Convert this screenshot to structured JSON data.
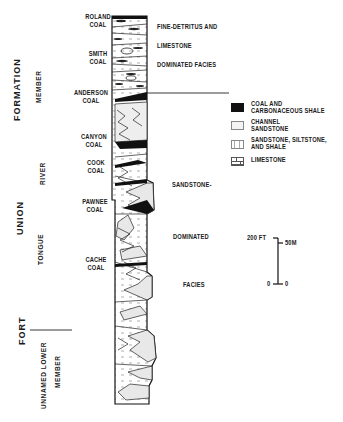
{
  "coal_labels": [
    {
      "name": "ROLAND",
      "sub": "COAL"
    },
    {
      "name": "SMITH",
      "sub": "COAL"
    },
    {
      "name": "ANDERSON",
      "sub": "COAL"
    },
    {
      "name": "CANYON",
      "sub": "COAL"
    },
    {
      "name": "COOK",
      "sub": "COAL"
    },
    {
      "name": "PAWNEE",
      "sub": "COAL"
    },
    {
      "name": "CACHE",
      "sub": "COAL"
    }
  ],
  "stratigraphy": {
    "formation_line1": "FORMATION",
    "formation_line2": "UNION",
    "formation_line3": "FORT",
    "member_upper_a": "MEMBER",
    "member_upper_b": "RIVER",
    "member_upper_c": "TONGUE",
    "member_lower_a": "UNNAMED LOWER",
    "member_lower_b": "MEMBER"
  },
  "facies": {
    "upper": [
      "FINE-DETRITUS AND",
      "LIMESTONE",
      "DOMINATED FACIES"
    ],
    "lower": [
      "SANDSTONE-",
      "DOMINATED",
      "FACIES"
    ]
  },
  "legend": [
    {
      "label1": "COAL AND",
      "label2": "CARBONACEOUS SHALE",
      "pattern": "coal",
      "color": "#111111"
    },
    {
      "label1": "CHANNEL",
      "label2": "SANDSTONE",
      "pattern": "channel",
      "color": "#f2f2f2"
    },
    {
      "label1": "SANDSTONE, SILTSTONE,",
      "label2": "AND SHALE",
      "pattern": "sandstone-siltstone-shale",
      "color": "#ffffff"
    },
    {
      "label1": "LIMESTONE",
      "label2": "",
      "pattern": "limestone",
      "color": "#ffffff"
    }
  ],
  "scale_bar": {
    "top_left": "200 FT",
    "top_right": "50M",
    "bottom_left": "0",
    "bottom_right": "0"
  }
}
